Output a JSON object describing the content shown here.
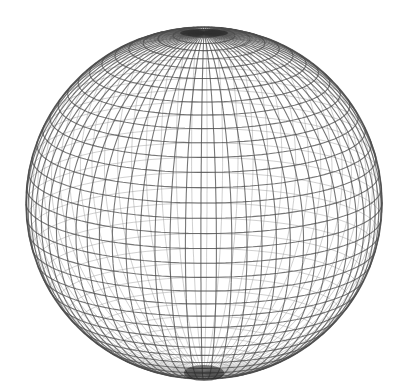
{
  "figure": {
    "title": "Wireframe sphere",
    "background": "#ffffff",
    "line_color": "#4a4a4a",
    "back_line_color": "#8a8a8a",
    "pole_shade_color": "#1a1a1a"
  },
  "sphere": {
    "center_x": 204,
    "center_y": 203,
    "radius_x": 178,
    "radius_y": 176,
    "tilt_deg": 15,
    "rotation_deg": 4,
    "latitude_lines": 36,
    "longitude_lines": 72,
    "front_stroke_width": 1.1,
    "back_stroke_width": 0.9,
    "front_opacity": 0.75,
    "back_opacity": 0.45
  }
}
